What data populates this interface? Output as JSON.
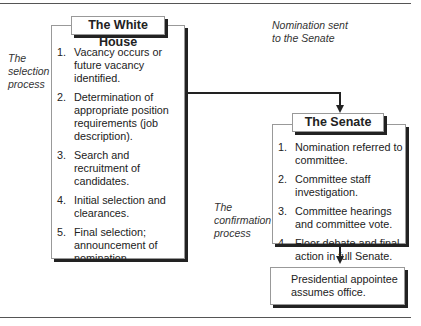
{
  "diagram": {
    "white_house": {
      "title": "The White House",
      "side_label": [
        "The",
        "selection",
        "process"
      ],
      "steps": [
        {
          "num": "1.",
          "text": "Vacancy occurs or future vacancy identified."
        },
        {
          "num": "2.",
          "text": "Determination of appropriate position requirements (job description)."
        },
        {
          "num": "3.",
          "text": "Search and recruitment of candidates."
        },
        {
          "num": "4.",
          "text": "Initial selection and clearances."
        },
        {
          "num": "5.",
          "text": "Final selection; announcement of nomination."
        }
      ]
    },
    "connector_label": [
      "Nomination sent",
      "to the Senate"
    ],
    "senate": {
      "title": "The Senate",
      "side_label": [
        "The",
        "confirmation",
        "process"
      ],
      "steps": [
        {
          "num": "1.",
          "text": "Nomination referred to committee."
        },
        {
          "num": "2.",
          "text": "Committee staff investigation."
        },
        {
          "num": "3.",
          "text": "Committee hearings and committee vote."
        },
        {
          "num": "4.",
          "text": "Floor debate and final action in full Senate."
        }
      ]
    },
    "final": {
      "text": "Presidential appointee assumes office."
    }
  }
}
